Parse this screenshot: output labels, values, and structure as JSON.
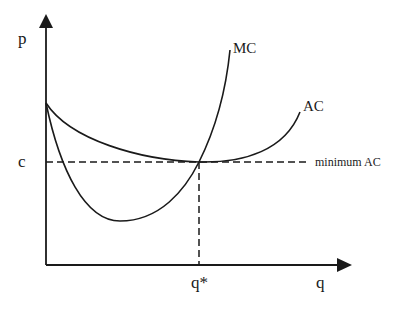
{
  "diagram": {
    "type": "cost-curves",
    "axes": {
      "y_label": "p",
      "x_label": "q"
    },
    "curves": [
      {
        "name": "MC",
        "label": "MC",
        "shape": "U-shaped, steep, crosses AC at its minimum"
      },
      {
        "name": "AC",
        "label": "AC",
        "shape": "U-shaped, shallow, minimum at q*"
      }
    ],
    "reference_lines": {
      "horizontal": {
        "label": "minimum AC",
        "value_label": "c",
        "style": "dashed"
      },
      "vertical": {
        "value_label": "q*",
        "style": "dashed"
      }
    },
    "labels": {
      "p": "p",
      "q": "q",
      "c": "c",
      "q_star": "q*",
      "mc": "MC",
      "ac": "AC",
      "minimum_ac": "minimum AC"
    }
  }
}
